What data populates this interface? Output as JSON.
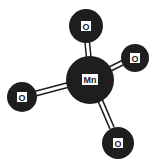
{
  "diagram": {
    "central_atom": {
      "label": "Mn",
      "cx": 90,
      "cy": 80,
      "r": 24
    },
    "atoms": [
      {
        "id": "o-top",
        "label": "O",
        "cx": 86,
        "cy": 26,
        "r": 17
      },
      {
        "id": "o-right",
        "label": "O",
        "cx": 135,
        "cy": 58,
        "r": 14
      },
      {
        "id": "o-left",
        "label": "O",
        "cx": 22,
        "cy": 97,
        "r": 15
      },
      {
        "id": "o-bottom",
        "label": "O",
        "cx": 118,
        "cy": 143,
        "r": 16
      }
    ],
    "colors": {
      "atom_fill": "#1e1e1e",
      "label_box": "#ffffff",
      "bond": "#1e1e1e",
      "bond_gap": "#ffffff"
    }
  }
}
